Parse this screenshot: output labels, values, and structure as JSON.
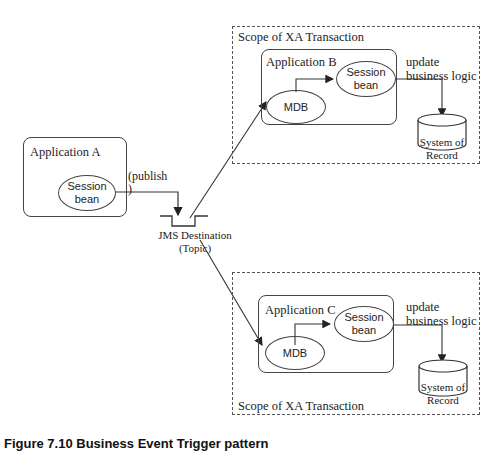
{
  "diagram": {
    "scope_top": {
      "label": "Scope of XA Transaction"
    },
    "scope_bottom": {
      "label": "Scope of XA Transaction"
    },
    "app_a": {
      "label": "Application A",
      "session_bean": "Session\nbean"
    },
    "app_b": {
      "label": "Application B",
      "mdb": "MDB",
      "session_bean": "Session\nbean",
      "update_label": "update\nbusiness logic",
      "record_label": "System of\nRecord"
    },
    "app_c": {
      "label": "Application C",
      "mdb": "MDB",
      "session_bean": "Session\nbean",
      "update_label": "update\nbusiness logic",
      "record_label": "System of\nRecord"
    },
    "publish_label": "(publish\n)",
    "jms_destination": "JMS Destination\n(Topic)",
    "caption": "Figure 7.10 Business Event Trigger pattern"
  }
}
